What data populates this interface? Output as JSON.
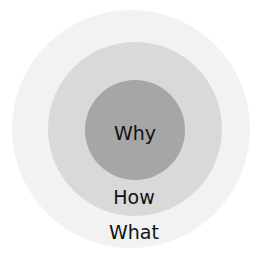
{
  "diagram": {
    "type": "concentric-circles",
    "circles": [
      {
        "name": "what",
        "label": "What",
        "color": "#f2f2f2",
        "cx": 131,
        "cy": 129,
        "r": 119,
        "label_x": 134,
        "label_y": 232
      },
      {
        "name": "how",
        "label": "How",
        "color": "#d9d9d9",
        "cx": 135,
        "cy": 129,
        "r": 87,
        "label_x": 134,
        "label_y": 197
      },
      {
        "name": "why",
        "label": "Why",
        "color": "#a6a6a6",
        "cx": 135,
        "cy": 130,
        "r": 50,
        "label_x": 135,
        "label_y": 133
      }
    ]
  }
}
